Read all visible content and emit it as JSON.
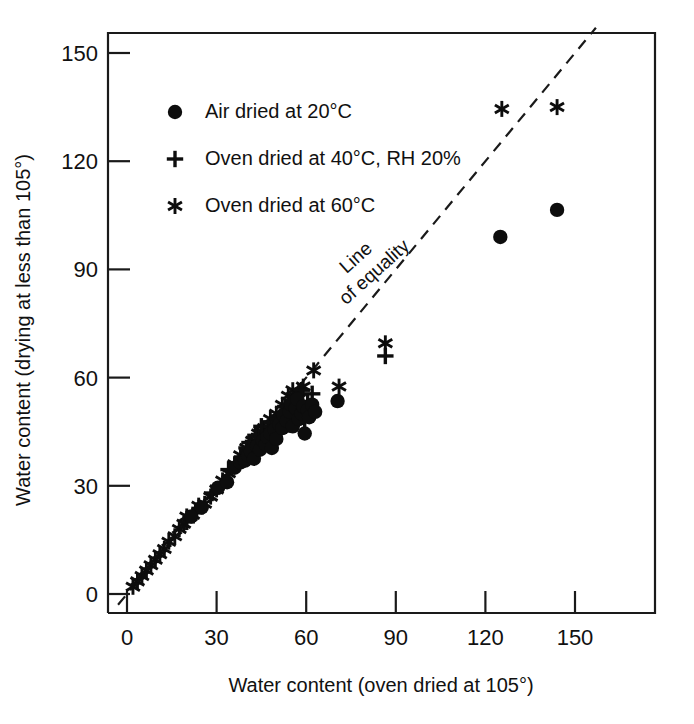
{
  "chart_data": {
    "type": "scatter",
    "title": "",
    "xlabel": "Water content (oven dried at 105°)",
    "ylabel": "Water content (drying at less than 105°)",
    "xlim": [
      0,
      157
    ],
    "ylim": [
      0,
      157
    ],
    "xticks": [
      0,
      30,
      60,
      90,
      120,
      150
    ],
    "yticks": [
      0,
      30,
      60,
      90,
      120,
      150
    ],
    "xticklabels": [
      "0",
      "30",
      "60",
      "90",
      "120",
      "150"
    ],
    "yticklabels": [
      "0",
      "30",
      "60",
      "90",
      "120",
      "150"
    ],
    "grid": false,
    "legend_position": "upper-left",
    "annotations": [
      {
        "text": "Line of equality",
        "line1": "Line",
        "line2": "of equality",
        "x": 78,
        "y": 92,
        "rotation": -42
      }
    ],
    "reference_line": {
      "name": "line-of-equality",
      "type": "dashed",
      "from": [
        -3,
        -3
      ],
      "to": [
        157,
        157
      ],
      "slope": 1,
      "intercept": 0
    },
    "series": [
      {
        "name": "Air dried at 20°C",
        "marker": "circle",
        "color": "#0d0d0d",
        "points": [
          [
            30.5,
            29.5
          ],
          [
            33.5,
            31.0
          ],
          [
            36.0,
            35.0
          ],
          [
            38.0,
            36.5
          ],
          [
            39.5,
            37.0
          ],
          [
            40.5,
            38.5
          ],
          [
            41.5,
            39.5
          ],
          [
            42.5,
            37.5
          ],
          [
            43.5,
            41.0
          ],
          [
            44.5,
            40.0
          ],
          [
            45.5,
            42.5
          ],
          [
            46.5,
            41.5
          ],
          [
            47.0,
            43.5
          ],
          [
            48.0,
            44.5
          ],
          [
            48.5,
            40.5
          ],
          [
            49.5,
            45.5
          ],
          [
            50.0,
            43.0
          ],
          [
            51.0,
            47.0
          ],
          [
            52.0,
            46.0
          ],
          [
            52.5,
            49.5
          ],
          [
            53.5,
            48.0
          ],
          [
            54.5,
            50.5
          ],
          [
            55.0,
            52.5
          ],
          [
            55.5,
            46.5
          ],
          [
            56.5,
            51.5
          ],
          [
            57.0,
            54.0
          ],
          [
            57.5,
            48.5
          ],
          [
            58.5,
            50.0
          ],
          [
            59.0,
            52.0
          ],
          [
            59.5,
            44.5
          ],
          [
            60.5,
            51.0
          ],
          [
            61.0,
            49.0
          ],
          [
            62.0,
            52.5
          ],
          [
            63.0,
            50.5
          ],
          [
            70.5,
            53.5
          ],
          [
            21.5,
            21.5
          ],
          [
            25.0,
            24.0
          ],
          [
            125.0,
            99.0
          ],
          [
            144.0,
            106.5
          ]
        ]
      },
      {
        "name": "Oven dried at 40°C, RH 20%",
        "marker": "plus",
        "color": "#0d0d0d",
        "points": [
          [
            34.0,
            34.5
          ],
          [
            36.5,
            36.0
          ],
          [
            38.5,
            38.0
          ],
          [
            40.0,
            40.5
          ],
          [
            41.0,
            42.0
          ],
          [
            42.0,
            39.0
          ],
          [
            43.0,
            44.0
          ],
          [
            44.0,
            41.5
          ],
          [
            45.0,
            46.5
          ],
          [
            46.0,
            43.0
          ],
          [
            47.5,
            45.0
          ],
          [
            48.5,
            47.5
          ],
          [
            49.0,
            44.0
          ],
          [
            50.5,
            48.5
          ],
          [
            51.5,
            46.0
          ],
          [
            52.5,
            50.0
          ],
          [
            53.0,
            52.0
          ],
          [
            54.0,
            47.0
          ],
          [
            55.5,
            49.5
          ],
          [
            56.5,
            54.5
          ],
          [
            57.5,
            51.5
          ],
          [
            58.5,
            56.5
          ],
          [
            59.5,
            48.0
          ],
          [
            60.5,
            53.0
          ],
          [
            62.0,
            55.5
          ],
          [
            86.5,
            66.0
          ],
          [
            20.0,
            20.0
          ],
          [
            23.0,
            22.5
          ],
          [
            28.5,
            28.0
          ]
        ]
      },
      {
        "name": "Oven dried at 60°C",
        "marker": "asterisk",
        "color": "#0d0d0d",
        "points": [
          [
            2.0,
            2.0
          ],
          [
            3.5,
            3.5
          ],
          [
            5.0,
            5.0
          ],
          [
            6.5,
            6.5
          ],
          [
            8.0,
            8.0
          ],
          [
            9.5,
            9.5
          ],
          [
            11.0,
            11.0
          ],
          [
            12.5,
            12.5
          ],
          [
            14.0,
            14.5
          ],
          [
            16.0,
            16.0
          ],
          [
            17.5,
            18.0
          ],
          [
            19.0,
            19.5
          ],
          [
            20.0,
            21.5
          ],
          [
            22.0,
            22.0
          ],
          [
            24.0,
            24.5
          ],
          [
            26.0,
            25.0
          ],
          [
            28.0,
            27.0
          ],
          [
            30.0,
            29.0
          ],
          [
            32.0,
            31.5
          ],
          [
            34.0,
            33.5
          ],
          [
            36.0,
            36.0
          ],
          [
            38.0,
            38.5
          ],
          [
            40.0,
            40.5
          ],
          [
            42.0,
            42.5
          ],
          [
            44.0,
            44.5
          ],
          [
            46.0,
            46.0
          ],
          [
            48.0,
            48.5
          ],
          [
            50.0,
            50.0
          ],
          [
            52.0,
            52.5
          ],
          [
            54.0,
            55.0
          ],
          [
            55.5,
            56.5
          ],
          [
            57.5,
            56.0
          ],
          [
            59.0,
            57.5
          ],
          [
            62.5,
            62.0
          ],
          [
            71.0,
            57.5
          ],
          [
            86.5,
            69.5
          ],
          [
            125.5,
            134.5
          ],
          [
            144.0,
            135.0
          ]
        ]
      }
    ]
  },
  "legend": {
    "items": [
      {
        "marker": "circle",
        "label": "Air dried at 20°C"
      },
      {
        "marker": "plus",
        "label": "Oven dried at 40°C, RH 20%"
      },
      {
        "marker": "asterisk",
        "label": "Oven dried at 60°C"
      }
    ]
  },
  "colors": {
    "ink": "#111111",
    "marker": "#0d0d0d",
    "background": "#ffffff"
  }
}
